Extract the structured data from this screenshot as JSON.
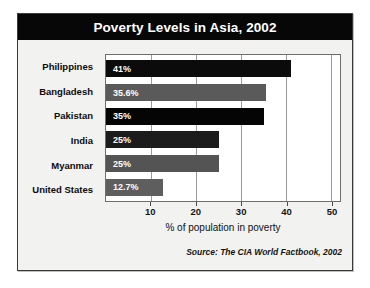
{
  "chart_data": {
    "type": "bar",
    "orientation": "horizontal",
    "title": "Poverty Levels in Asia, 2002",
    "xlabel": "% of population in poverty",
    "ylabel": "",
    "xlim": [
      0,
      52
    ],
    "xticks": [
      10,
      20,
      30,
      40,
      50
    ],
    "grid": true,
    "legend": false,
    "categories": [
      "Philippines",
      "Bangladesh",
      "Pakistan",
      "India",
      "Myanmar",
      "United States"
    ],
    "values": [
      41,
      35.6,
      35,
      25,
      25,
      12.7
    ],
    "value_labels": [
      "41%",
      "35.6%",
      "35%",
      "25%",
      "25%",
      "12.7%"
    ],
    "bar_colors": [
      "#0b0b0b",
      "#5a5a5a",
      "#050505",
      "#1c1c1c",
      "#545454",
      "#5e5e5e"
    ],
    "source": "Source: The CIA World Factbook, 2002"
  },
  "style": {
    "title_bar_bg": "#070707",
    "title_color": "#ffffff",
    "card_bg": "#f2f2f0",
    "plot_bg": "#ffffff",
    "grid_color": "#9a9a9a",
    "border_color": "#3a3a3a",
    "label_color": "#0b0b0b",
    "value_label_color": "#ffffff"
  }
}
